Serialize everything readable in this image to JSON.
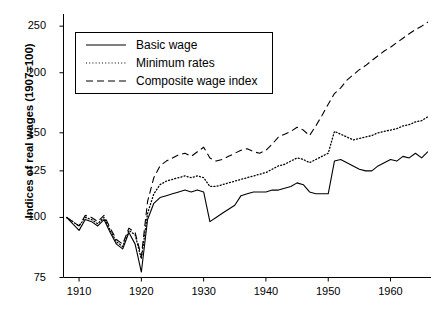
{
  "chart_data": {
    "type": "line",
    "title": "",
    "xlabel": "",
    "ylabel": "Indices of real wages (1907=100)",
    "yscale": "log",
    "ylim": [
      75,
      265
    ],
    "xlim": [
      1907.5,
      1966.5
    ],
    "grid": false,
    "legend_position": "top-left",
    "yticks": [
      75,
      100,
      125,
      150,
      200,
      250
    ],
    "ytick_labels": [
      "75",
      "100",
      "125",
      "150",
      "200",
      "250"
    ],
    "xticks": [
      1910,
      1920,
      1930,
      1940,
      1950,
      1960
    ],
    "xtick_labels": [
      "1910",
      "1920",
      "1930",
      "1940",
      "1950",
      "1960"
    ],
    "x": [
      1908,
      1909,
      1910,
      1911,
      1912,
      1913,
      1914,
      1915,
      1916,
      1917,
      1918,
      1919,
      1920,
      1921,
      1922,
      1923,
      1924,
      1925,
      1926,
      1927,
      1928,
      1929,
      1930,
      1931,
      1932,
      1933,
      1934,
      1935,
      1936,
      1937,
      1938,
      1939,
      1940,
      1941,
      1942,
      1943,
      1944,
      1945,
      1946,
      1947,
      1948,
      1949,
      1950,
      1951,
      1952,
      1953,
      1954,
      1955,
      1956,
      1957,
      1958,
      1959,
      1960,
      1961,
      1962,
      1963,
      1964,
      1965,
      1966
    ],
    "series": [
      {
        "name": "Basic wage",
        "style": "solid",
        "color": "#000000",
        "values": [
          100,
          97,
          94,
          99,
          98,
          96,
          99,
          93,
          88,
          86,
          93,
          88,
          77,
          99,
          107,
          110,
          111,
          112,
          113,
          114,
          113,
          114,
          113,
          98,
          100,
          102,
          104,
          106,
          111,
          112,
          113,
          113,
          113,
          114,
          114,
          115,
          116,
          118,
          117,
          113,
          112,
          112,
          112,
          131,
          132,
          130,
          128,
          126,
          125,
          125,
          128,
          130,
          132,
          131,
          134,
          133,
          136,
          133,
          137
        ]
      },
      {
        "name": "Minimum rates",
        "style": "dotted",
        "color": "#000000",
        "values": [
          100,
          98,
          96,
          100,
          99,
          97,
          100,
          94,
          89,
          87,
          94,
          92,
          82,
          102,
          112,
          117,
          119,
          120,
          121,
          122,
          121,
          122,
          121,
          116,
          116,
          117,
          118,
          119,
          120,
          121,
          122,
          123,
          124,
          126,
          128,
          129,
          131,
          133,
          132,
          130,
          132,
          134,
          136,
          151,
          149,
          147,
          145,
          146,
          147,
          148,
          150,
          151,
          152,
          153,
          155,
          156,
          158,
          159,
          162
        ]
      },
      {
        "name": "Composite wage index",
        "style": "dashed",
        "color": "#000000",
        "values": [
          100,
          98,
          96,
          101,
          100,
          98,
          101,
          95,
          90,
          88,
          95,
          93,
          83,
          108,
          121,
          128,
          131,
          133,
          135,
          136,
          134,
          137,
          140,
          133,
          131,
          132,
          134,
          136,
          138,
          139,
          137,
          136,
          138,
          142,
          147,
          149,
          151,
          154,
          152,
          148,
          155,
          163,
          172,
          181,
          186,
          193,
          198,
          203,
          207,
          212,
          217,
          222,
          226,
          231,
          236,
          241,
          246,
          250,
          255
        ]
      }
    ]
  },
  "legend": {
    "entries": [
      {
        "label": "Basic wage",
        "style": "solid"
      },
      {
        "label": "Minimum rates",
        "style": "dotted"
      },
      {
        "label": "Composite wage index",
        "style": "dashed"
      }
    ]
  }
}
